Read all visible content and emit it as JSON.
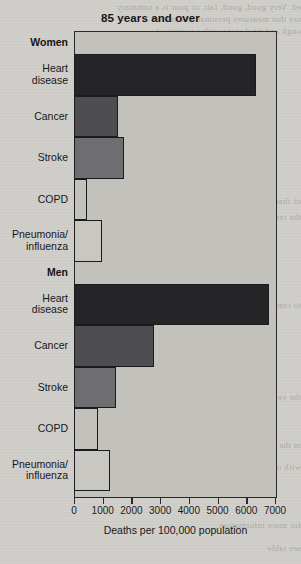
{
  "chart_data": {
    "type": "bar",
    "orientation": "horizontal",
    "title": "85 years and over",
    "xlabel": "Deaths per 100,000 population",
    "ylabel": "",
    "xlim": [
      0,
      7000
    ],
    "xticks": [
      0,
      1000,
      2000,
      3000,
      4000,
      5000,
      6000,
      7000
    ],
    "xtick_labels": [
      "0",
      "1000",
      "2000",
      "3000",
      "4000",
      "5000",
      "6000",
      "7000"
    ],
    "grid": false,
    "legend": "none",
    "groups": [
      {
        "name": "Women",
        "categories": [
          "Heart disease",
          "Cancer",
          "Stroke",
          "COPD",
          "Pneumonia/ influenza"
        ],
        "values": [
          6350,
          1520,
          1750,
          450,
          980
        ]
      },
      {
        "name": "Men",
        "categories": [
          "Heart disease",
          "Cancer",
          "Stroke",
          "COPD",
          "Pneumonia/ influenza"
        ],
        "values": [
          6780,
          2800,
          1450,
          830,
          1250
        ]
      }
    ],
    "bar_colors": [
      "#252527",
      "#4e4e50",
      "#6e6e70",
      "#c3c1bc",
      "#c9c7c2"
    ],
    "frame_color": "#2a2a2c",
    "plot_background": "#c3c1bc"
  },
  "labels": {
    "women_group": "Women",
    "men_group": "Men",
    "heart_disease": "Heart disease",
    "cancer": "Cancer",
    "stroke": "Stroke",
    "copd": "COPD",
    "pneumonia": "Pneumonia/ influenza",
    "pneumonia_line1": "Pneumonia/",
    "pneumonia_line2": "influenza",
    "heart_line1": "Heart",
    "heart_line2": "disease"
  },
  "bleed_text": {
    "l0": "ed. Very good, good, fair, or poor is a summary",
    "l1": "ure that measures personal and mental",
    "l2": "ough and final steps with a variety of",
    "l3": "of that section and of the",
    "l4": "the results of the study",
    "l5": "to consider in the analysis",
    "l6": "the years and over group",
    "l7": "in the data shown above",
    "l8": "with other causes",
    "l9": "for more information",
    "l10": "see table"
  }
}
